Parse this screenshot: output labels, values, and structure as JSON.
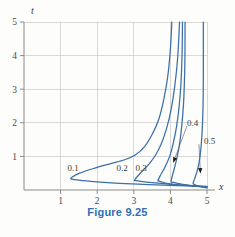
{
  "caption": "Figure 9.25",
  "axes": {
    "x_label": "x",
    "y_label": "t",
    "x_ticks": [
      "1",
      "2",
      "3",
      "4",
      "5"
    ],
    "y_ticks": [
      "1",
      "2",
      "3",
      "4",
      "5"
    ]
  },
  "curve_labels": {
    "c1": "0.1",
    "c2": "0.2",
    "c3": "0.3",
    "c4": "0.4",
    "c5": "0.5"
  },
  "chart_data": {
    "type": "line",
    "title": "Figure 9.25",
    "xlabel": "x",
    "ylabel": "t",
    "xlim": [
      0,
      5
    ],
    "ylim": [
      0,
      5
    ],
    "xticks": [
      1,
      2,
      3,
      4,
      5
    ],
    "yticks": [
      1,
      2,
      3,
      4,
      5
    ],
    "grid": true,
    "legend": "inline-curve-labels",
    "axis_color": "#8a8a8a",
    "grid_color": "#c9c9c9",
    "curve_color": "#3b6fa8",
    "caption_color": "#2f6fb5",
    "series": [
      {
        "name": "0.1",
        "label": "0.1",
        "label_at": [
          1.75,
          0.45
        ],
        "asymptote_x": 4.05,
        "nose_x": 1.28,
        "nose_t": 0.33,
        "points": [
          [
            5.0,
            0.11
          ],
          [
            4.2,
            0.13
          ],
          [
            3.4,
            0.16
          ],
          [
            2.6,
            0.2
          ],
          [
            2.0,
            0.24
          ],
          [
            1.6,
            0.28
          ],
          [
            1.38,
            0.31
          ],
          [
            1.28,
            0.33
          ],
          [
            1.32,
            0.39
          ],
          [
            1.52,
            0.5
          ],
          [
            1.9,
            0.64
          ],
          [
            2.35,
            0.78
          ],
          [
            2.75,
            0.9
          ],
          [
            3.05,
            1.05
          ],
          [
            3.3,
            1.3
          ],
          [
            3.5,
            1.65
          ],
          [
            3.68,
            2.1
          ],
          [
            3.82,
            2.7
          ],
          [
            3.93,
            3.4
          ],
          [
            4.0,
            4.2
          ],
          [
            4.04,
            5.0
          ]
        ]
      },
      {
        "name": "0.2",
        "label": "0.2",
        "label_at": [
          3.1,
          0.45
        ],
        "asymptote_x": 4.25,
        "nose_x": 3.02,
        "nose_t": 0.29,
        "points": [
          [
            5.0,
            0.1
          ],
          [
            4.5,
            0.13
          ],
          [
            4.0,
            0.17
          ],
          [
            3.5,
            0.22
          ],
          [
            3.18,
            0.26
          ],
          [
            3.05,
            0.28
          ],
          [
            3.02,
            0.29
          ],
          [
            3.08,
            0.38
          ],
          [
            3.22,
            0.55
          ],
          [
            3.42,
            0.78
          ],
          [
            3.6,
            1.05
          ],
          [
            3.76,
            1.4
          ],
          [
            3.9,
            1.85
          ],
          [
            4.02,
            2.4
          ],
          [
            4.12,
            3.1
          ],
          [
            4.2,
            3.95
          ],
          [
            4.25,
            5.0
          ]
        ]
      },
      {
        "name": "0.3",
        "label": "0.3",
        "label_at": [
          3.62,
          0.45
        ],
        "asymptote_x": 4.33,
        "nose_x": 3.66,
        "nose_t": 0.28,
        "points": [
          [
            5.0,
            0.09
          ],
          [
            4.6,
            0.12
          ],
          [
            4.2,
            0.16
          ],
          [
            3.9,
            0.2
          ],
          [
            3.74,
            0.25
          ],
          [
            3.68,
            0.27
          ],
          [
            3.66,
            0.28
          ],
          [
            3.72,
            0.42
          ],
          [
            3.85,
            0.68
          ],
          [
            3.98,
            1.0
          ],
          [
            4.08,
            1.4
          ],
          [
            4.17,
            1.9
          ],
          [
            4.24,
            2.5
          ],
          [
            4.29,
            3.2
          ],
          [
            4.32,
            4.1
          ],
          [
            4.33,
            5.0
          ]
        ]
      },
      {
        "name": "0.4",
        "label": "0.4",
        "label_at": [
          4.55,
          2.0
        ],
        "arrow_from": [
          4.45,
          1.9
        ],
        "arrow_to": [
          4.08,
          0.82
        ],
        "asymptote_x": 4.4,
        "nose_x": 4.02,
        "nose_t": 0.25,
        "points": [
          [
            5.0,
            0.08
          ],
          [
            4.72,
            0.11
          ],
          [
            4.45,
            0.15
          ],
          [
            4.2,
            0.2
          ],
          [
            4.08,
            0.23
          ],
          [
            4.02,
            0.25
          ],
          [
            4.06,
            0.45
          ],
          [
            4.15,
            0.82
          ],
          [
            4.24,
            1.3
          ],
          [
            4.31,
            1.9
          ],
          [
            4.36,
            2.6
          ],
          [
            4.39,
            3.5
          ],
          [
            4.4,
            4.4
          ],
          [
            4.4,
            5.0
          ]
        ]
      },
      {
        "name": "0.5",
        "label": "0.5",
        "label_at": [
          4.82,
          1.48
        ],
        "arrow_from": [
          4.78,
          1.36
        ],
        "arrow_to": [
          4.82,
          0.5
        ],
        "asymptote_x": 4.9,
        "nose_x": 4.62,
        "nose_t": 0.2,
        "points": [
          [
            5.0,
            0.06
          ],
          [
            4.85,
            0.09
          ],
          [
            4.72,
            0.13
          ],
          [
            4.65,
            0.17
          ],
          [
            4.62,
            0.2
          ],
          [
            4.66,
            0.33
          ],
          [
            4.74,
            0.6
          ],
          [
            4.81,
            1.0
          ],
          [
            4.86,
            1.6
          ],
          [
            4.89,
            2.4
          ],
          [
            4.9,
            3.4
          ],
          [
            4.9,
            4.4
          ],
          [
            4.9,
            5.0
          ]
        ]
      }
    ]
  }
}
